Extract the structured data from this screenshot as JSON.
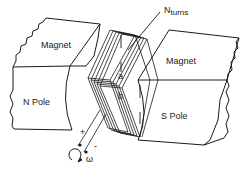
{
  "diagram": {
    "left_magnet": {
      "top_label": "Magnet",
      "face_label": "N Pole"
    },
    "right_magnet": {
      "top_label": "Magnet",
      "face_label": "S Pole"
    },
    "coil": {
      "turns_label_main": "N",
      "turns_label_sub": "turns",
      "dim_a": "a",
      "dim_b": "b"
    },
    "terminals": {
      "plus": "+",
      "minus": "-"
    },
    "rotation": {
      "symbol": "ω"
    },
    "colors": {
      "line": "#1a1a1a",
      "background": "#ffffff",
      "text": "#222222"
    }
  }
}
